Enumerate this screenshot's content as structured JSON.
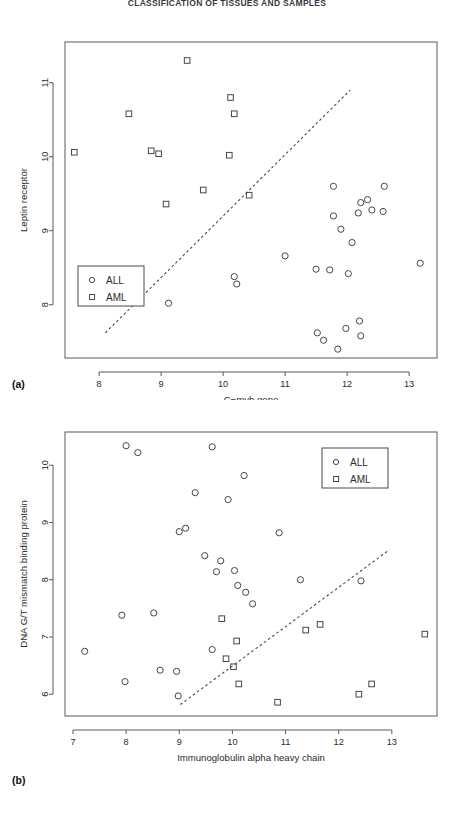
{
  "running_head": "CLASSIFICATION OF TISSUES AND SAMPLES",
  "panels": [
    {
      "id": "a",
      "label": "(a)",
      "xlabel": "C−myb gene",
      "ylabel": "Leptin receptor",
      "legend": {
        "position": "bottom-left",
        "entries": [
          {
            "label": "ALL",
            "marker": "circle"
          },
          {
            "label": "AML",
            "marker": "square"
          }
        ]
      }
    },
    {
      "id": "b",
      "label": "(b)",
      "xlabel": "Immunoglobulin alpha heavy chain",
      "ylabel": "DNA G/T mismatch binding protein",
      "legend": {
        "position": "top-right",
        "entries": [
          {
            "label": "ALL",
            "marker": "circle"
          },
          {
            "label": "AML",
            "marker": "square"
          }
        ]
      }
    }
  ],
  "chart_data": [
    {
      "type": "scatter",
      "panel": "a",
      "title": "",
      "xlabel": "C−myb gene",
      "ylabel": "Leptin receptor",
      "xlim": [
        7.45,
        13.45
      ],
      "ylim": [
        7.28,
        11.55
      ],
      "xticks": [
        8,
        9,
        10,
        11,
        12,
        13
      ],
      "yticks": [
        8,
        9,
        10,
        11
      ],
      "grid": false,
      "legend_position": "bottom-left",
      "series": [
        {
          "name": "ALL",
          "marker": "circle",
          "points": [
            [
              9.12,
              8.02
            ],
            [
              10.18,
              8.38
            ],
            [
              10.22,
              8.28
            ],
            [
              11.0,
              8.66
            ],
            [
              11.5,
              8.48
            ],
            [
              11.72,
              8.47
            ],
            [
              12.02,
              8.42
            ],
            [
              11.78,
              9.6
            ],
            [
              11.78,
              9.2
            ],
            [
              11.9,
              9.02
            ],
            [
              12.08,
              8.84
            ],
            [
              12.22,
              9.38
            ],
            [
              12.33,
              9.42
            ],
            [
              12.18,
              9.24
            ],
            [
              12.4,
              9.28
            ],
            [
              12.6,
              9.6
            ],
            [
              12.58,
              9.26
            ],
            [
              13.18,
              8.56
            ],
            [
              11.52,
              7.62
            ],
            [
              11.62,
              7.52
            ],
            [
              11.98,
              7.68
            ],
            [
              11.85,
              7.4
            ],
            [
              12.2,
              7.78
            ],
            [
              12.22,
              7.58
            ]
          ]
        },
        {
          "name": "AML",
          "marker": "square",
          "points": [
            [
              7.6,
              10.06
            ],
            [
              8.48,
              10.58
            ],
            [
              8.84,
              10.08
            ],
            [
              8.96,
              10.04
            ],
            [
              9.08,
              9.36
            ],
            [
              9.42,
              11.3
            ],
            [
              9.68,
              9.55
            ],
            [
              10.1,
              10.02
            ],
            [
              10.12,
              10.8
            ],
            [
              10.42,
              9.48
            ],
            [
              10.18,
              10.58
            ]
          ]
        }
      ],
      "trend_line": {
        "style": "dashed",
        "x": [
          8.1,
          12.05
        ],
        "y": [
          7.62,
          10.9
        ]
      }
    },
    {
      "type": "scatter",
      "panel": "b",
      "title": "",
      "xlabel": "Immunoglobulin alpha heavy chain",
      "ylabel": "DNA G/T mismatch binding protein",
      "xlim": [
        6.85,
        13.85
      ],
      "ylim": [
        5.62,
        10.58
      ],
      "xticks": [
        7,
        8,
        9,
        10,
        11,
        12,
        13
      ],
      "yticks": [
        6,
        7,
        8,
        9,
        10
      ],
      "grid": false,
      "legend_position": "top-right",
      "series": [
        {
          "name": "ALL",
          "marker": "circle",
          "points": [
            [
              7.22,
              6.75
            ],
            [
              7.92,
              7.38
            ],
            [
              7.98,
              6.22
            ],
            [
              8.0,
              10.34
            ],
            [
              8.22,
              10.22
            ],
            [
              8.52,
              7.42
            ],
            [
              8.64,
              6.42
            ],
            [
              8.95,
              6.4
            ],
            [
              8.98,
              5.97
            ],
            [
              9.0,
              8.84
            ],
            [
              9.12,
              8.9
            ],
            [
              9.3,
              9.52
            ],
            [
              9.48,
              8.42
            ],
            [
              9.62,
              10.32
            ],
            [
              9.7,
              8.14
            ],
            [
              9.78,
              8.33
            ],
            [
              9.62,
              6.78
            ],
            [
              9.92,
              9.4
            ],
            [
              10.04,
              8.16
            ],
            [
              10.1,
              7.9
            ],
            [
              10.22,
              9.82
            ],
            [
              10.25,
              7.78
            ],
            [
              10.38,
              7.58
            ],
            [
              10.88,
              8.82
            ],
            [
              11.28,
              8.0
            ],
            [
              12.42,
              7.98
            ]
          ]
        },
        {
          "name": "AML",
          "marker": "square",
          "points": [
            [
              9.8,
              7.32
            ],
            [
              9.88,
              6.62
            ],
            [
              10.08,
              6.93
            ],
            [
              10.12,
              6.18
            ],
            [
              10.02,
              6.48
            ],
            [
              10.85,
              5.86
            ],
            [
              11.38,
              7.12
            ],
            [
              11.65,
              7.22
            ],
            [
              12.38,
              6.0
            ],
            [
              12.62,
              6.18
            ],
            [
              13.62,
              7.05
            ]
          ]
        }
      ],
      "trend_line": {
        "style": "dashed",
        "x": [
          9.02,
          12.95
        ],
        "y": [
          5.82,
          8.52
        ]
      }
    }
  ]
}
